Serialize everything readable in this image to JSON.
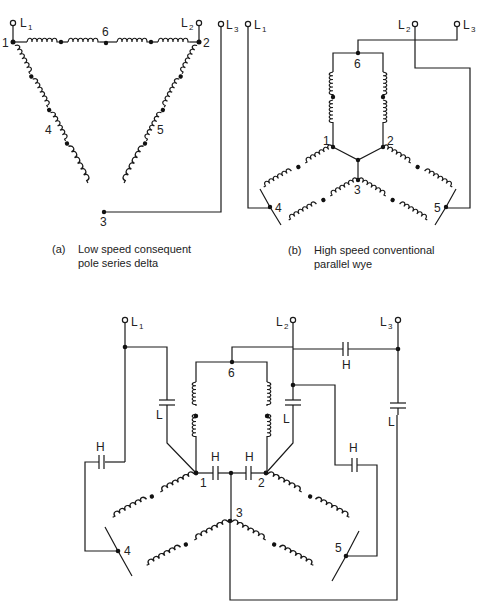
{
  "diagram_a": {
    "caption_tag": "(a)",
    "caption_line1": "Low speed consequent",
    "caption_line2": "pole series delta",
    "terminals": [
      "L1",
      "L2",
      "L3"
    ],
    "nodes": [
      "1",
      "2",
      "3",
      "4",
      "5",
      "6"
    ]
  },
  "diagram_b": {
    "caption_tag": "(b)",
    "caption_line1": "High speed conventional",
    "caption_line2": "parallel wye",
    "terminals": [
      "L1",
      "L2",
      "L3"
    ],
    "nodes": [
      "1",
      "2",
      "3",
      "4",
      "5",
      "6"
    ]
  },
  "diagram_c": {
    "terminals": [
      "L1",
      "L2",
      "L3"
    ],
    "nodes": [
      "1",
      "2",
      "3",
      "4",
      "5",
      "6"
    ],
    "capacitor_labels": {
      "high": "H",
      "low": "L"
    }
  },
  "labels": {
    "L": "L",
    "sub1": "1",
    "sub2": "2",
    "sub3": "3",
    "n1": "1",
    "n2": "2",
    "n3": "3",
    "n4": "4",
    "n5": "5",
    "n6": "6",
    "H": "H",
    "Lcap": "L"
  }
}
